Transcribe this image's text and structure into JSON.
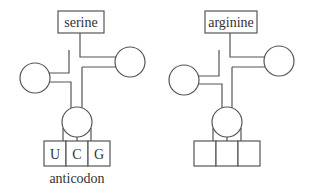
{
  "diagrams": [
    {
      "name": "trna-serine",
      "amino_acid": "serine",
      "anticodon_bases": [
        "U",
        "C",
        "G"
      ],
      "anticodon_label": "anticodon"
    },
    {
      "name": "trna-arginine",
      "amino_acid": "arginine",
      "anticodon_bases": [
        "",
        "",
        ""
      ],
      "anticodon_label": ""
    }
  ],
  "colors": {
    "line": "#555555",
    "text": "#333333",
    "background": "#ffffff"
  }
}
